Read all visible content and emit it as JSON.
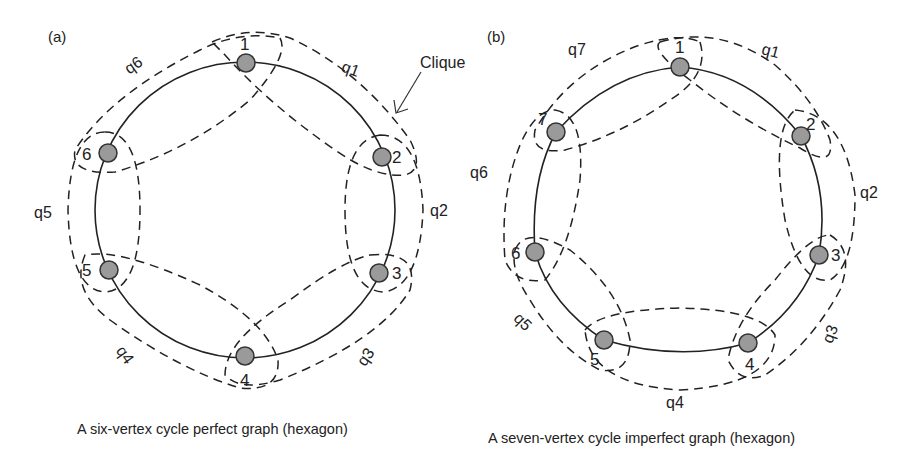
{
  "figure": {
    "panels": [
      {
        "id": "a",
        "panel_label": "(a)",
        "caption": "A six-vertex cycle perfect graph (hexagon)",
        "vertices": [
          "1",
          "2",
          "3",
          "4",
          "5",
          "6"
        ],
        "cliques": [
          "q1",
          "q2",
          "q3",
          "q4",
          "q5",
          "q6"
        ],
        "annotation": "Clique"
      },
      {
        "id": "b",
        "panel_label": "(b)",
        "caption": "A seven-vertex cycle imperfect graph (hexagon)",
        "vertices": [
          "1",
          "2",
          "3",
          "4",
          "5",
          "6",
          "7"
        ],
        "cliques": [
          "q1",
          "q2",
          "q3",
          "q4",
          "q5",
          "q6",
          "q7"
        ]
      }
    ],
    "colors": {
      "vertex_fill": "#9a9a9a",
      "stroke": "#222222",
      "background": "#ffffff"
    }
  }
}
